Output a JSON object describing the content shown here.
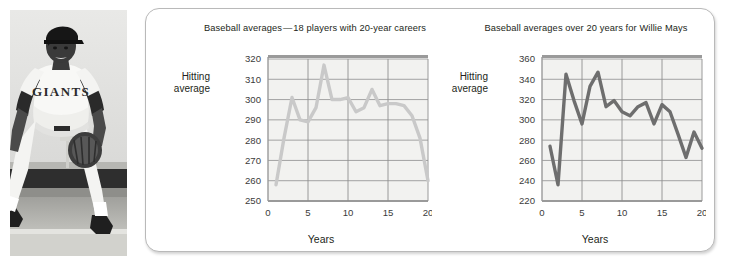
{
  "photo": {
    "alt_name": "baseball-player-photo",
    "description": "Black and white photograph of a baseball player in a Giants uniform crouching in a fielding stance with a glove",
    "jersey_text": "GIANTS"
  },
  "card": {
    "background": "#ffffff",
    "border_color": "#b9b9b9"
  },
  "chart_data": [
    {
      "id": "left",
      "type": "line",
      "title": "Baseball averages — 18 players with 20-year careers",
      "xlabel": "Years",
      "ylabel": "Hitting average",
      "ylabel_line1": "Hitting",
      "ylabel_line2": "average",
      "xlim": [
        0,
        20
      ],
      "ylim": [
        250,
        320
      ],
      "xticks": [
        0,
        5,
        10,
        15,
        20
      ],
      "yticks": [
        250,
        260,
        270,
        280,
        290,
        300,
        310,
        320
      ],
      "grid": true,
      "line_color": "#c9c9c9",
      "x": [
        1,
        2,
        3,
        4,
        5,
        6,
        7,
        8,
        9,
        10,
        11,
        12,
        13,
        14,
        15,
        16,
        17,
        18,
        19,
        20
      ],
      "values": [
        258,
        281,
        301,
        290,
        289,
        296,
        317,
        300,
        300,
        301,
        294,
        296,
        305,
        297,
        298,
        298,
        297,
        292,
        281,
        260
      ]
    },
    {
      "id": "right",
      "type": "line",
      "title": "Baseball averages over 20 years for Willie Mays",
      "xlabel": "Years",
      "ylabel": "Hitting average",
      "ylabel_line1": "Hitting",
      "ylabel_line2": "average",
      "xlim": [
        0,
        20
      ],
      "ylim": [
        220,
        360
      ],
      "xticks": [
        0,
        5,
        10,
        15,
        20
      ],
      "yticks": [
        220,
        240,
        260,
        280,
        300,
        320,
        340,
        360
      ],
      "grid": true,
      "line_color": "#6e6e6e",
      "x": [
        1,
        2,
        3,
        4,
        5,
        6,
        7,
        8,
        9,
        10,
        11,
        12,
        13,
        14,
        15,
        16,
        17,
        18,
        19,
        20
      ],
      "values": [
        274,
        236,
        345,
        319,
        296,
        333,
        347,
        313,
        319,
        308,
        304,
        313,
        317,
        296,
        315,
        308,
        286,
        263,
        288,
        272
      ]
    }
  ]
}
